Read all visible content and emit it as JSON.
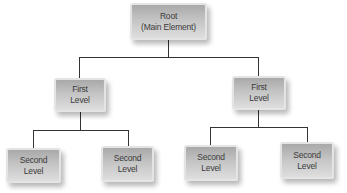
{
  "diagram": {
    "type": "tree",
    "root": {
      "line1": "Root",
      "line2": "(Main Element)"
    },
    "first_level": [
      {
        "line1": "First",
        "line2": "Level",
        "children": [
          {
            "line1": "Second",
            "line2": "Level"
          },
          {
            "line1": "Second",
            "line2": "Level"
          }
        ]
      },
      {
        "line1": "First",
        "line2": "Level",
        "children": [
          {
            "line1": "Second",
            "line2": "Level"
          },
          {
            "line1": "Second",
            "line2": "Level"
          }
        ]
      }
    ],
    "colors": {
      "connector": "#333333",
      "node_top": "#a9a9a9",
      "node_bottom": "#dedede",
      "node_border": "#e4e4e4",
      "text": "#3a3a3a"
    }
  }
}
